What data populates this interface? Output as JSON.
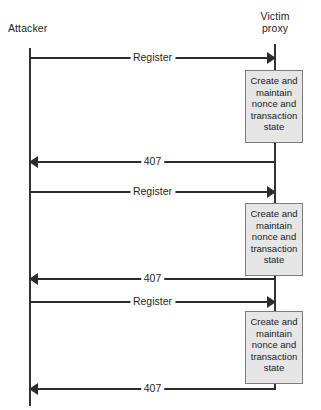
{
  "diagram": {
    "type": "sequence-diagram",
    "participants": [
      {
        "id": "attacker",
        "label": "Attacker"
      },
      {
        "id": "victim-proxy",
        "label": "Victim\nproxy"
      }
    ],
    "cycles": [
      {
        "request_label": "Register",
        "action_label": "Create and\nmaintain\nnonce and\ntransaction\nstate",
        "response_label": "407"
      },
      {
        "request_label": "Register",
        "action_label": "Create and\nmaintain\nnonce and\ntransaction\nstate",
        "response_label": "407"
      },
      {
        "request_label": "Register",
        "action_label": "Create and\nmaintain\nnonce and\ntransaction\nstate",
        "response_label": "407"
      }
    ],
    "colors": {
      "line": "#2b2b2b",
      "lifeline": "#333333",
      "box_fill": "#e6e6e6",
      "box_border": "#7d7d7d",
      "text": "#1f1f1f",
      "background": "#ffffff"
    }
  }
}
